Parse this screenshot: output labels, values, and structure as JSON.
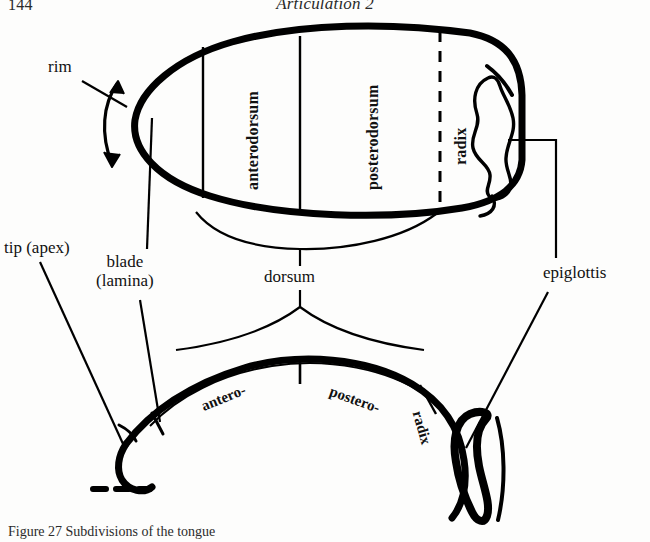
{
  "page": {
    "folio": "144",
    "running_title": "Articulation 2",
    "caption": "Figure 27 Subdivisions of the tongue"
  },
  "figure": {
    "title": "Subdivisions of the tongue",
    "views": [
      {
        "name": "superior-view",
        "description": "Tongue seen from above (dorsal / superior view), outlined as an elongated oval"
      },
      {
        "name": "sagittal-view",
        "description": "Tongue seen in mid-sagittal section, profile from tip to radix"
      }
    ],
    "ink_color": "#000000"
  },
  "labels": {
    "rim": "rim",
    "tip_apex": "tip (apex)",
    "blade_line1": "blade",
    "blade_line2": "(lamina)",
    "dorsum": "dorsum",
    "epiglottis": "epiglottis",
    "anterodorsum": "anterodorsum",
    "posterodorsum": "posterodorsum",
    "radix": "radix",
    "antero_short": "antero-",
    "postero_short": "postero-",
    "radix_lower": "radix"
  },
  "annotations": {
    "rim_marker": "double-headed-curved-arrow",
    "radix_boundary": "dashed-line",
    "tip_underside": "dashed-line",
    "dorsum_braces": "two-braces-meeting-at-dorsum",
    "leader_lines": 6
  }
}
